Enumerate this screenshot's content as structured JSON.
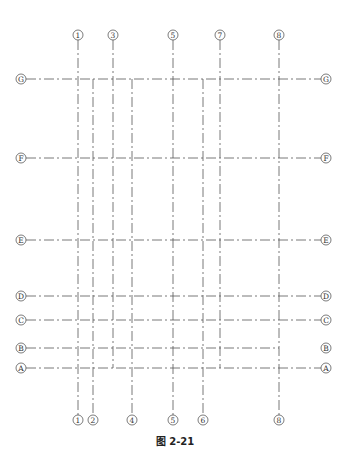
{
  "figure": {
    "caption": "图 2-21",
    "line_color": "#555555"
  },
  "vertical_axes": [
    {
      "id": "1",
      "label": "1",
      "x": 78,
      "y1": 40,
      "y2": 415,
      "top_label": true,
      "bottom_label": true
    },
    {
      "id": "2",
      "label": "2",
      "x": 93,
      "y1": 79,
      "y2": 415,
      "top_label": false,
      "bottom_label": true
    },
    {
      "id": "3",
      "label": "3",
      "x": 113,
      "y1": 40,
      "y2": 368,
      "top_label": true,
      "bottom_label": false
    },
    {
      "id": "4",
      "label": "4",
      "x": 132,
      "y1": 79,
      "y2": 415,
      "top_label": false,
      "bottom_label": true
    },
    {
      "id": "5",
      "label": "5",
      "x": 173,
      "y1": 40,
      "y2": 415,
      "top_label": true,
      "bottom_label": true
    },
    {
      "id": "6",
      "label": "6",
      "x": 203,
      "y1": 79,
      "y2": 415,
      "top_label": false,
      "bottom_label": true
    },
    {
      "id": "7",
      "label": "7",
      "x": 220,
      "y1": 40,
      "y2": 368,
      "top_label": true,
      "bottom_label": false
    },
    {
      "id": "8",
      "label": "8",
      "x": 279,
      "y1": 40,
      "y2": 415,
      "top_label": true,
      "bottom_label": true
    }
  ],
  "horizontal_axes": [
    {
      "id": "G",
      "label": "G",
      "y": 79,
      "x1": 26,
      "x2": 321,
      "right_connected": true
    },
    {
      "id": "F",
      "label": "F",
      "y": 158,
      "x1": 26,
      "x2": 321,
      "right_connected": true
    },
    {
      "id": "E",
      "label": "E",
      "y": 240,
      "x1": 26,
      "x2": 321,
      "right_connected": true
    },
    {
      "id": "D",
      "label": "D",
      "y": 296,
      "x1": 26,
      "x2": 321,
      "right_connected": true
    },
    {
      "id": "C",
      "label": "C",
      "y": 320,
      "x1": 26,
      "x2": 321,
      "right_connected": true
    },
    {
      "id": "B",
      "label": "B",
      "y": 348,
      "x1": 26,
      "x2": 279,
      "right_connected": false
    },
    {
      "id": "A",
      "label": "A",
      "y": 368,
      "x1": 26,
      "x2": 321,
      "right_connected": true
    }
  ],
  "label_positions": {
    "top_y": 35,
    "bottom_y": 420,
    "left_x": 21,
    "right_x": 326,
    "circle_radius": 5
  }
}
